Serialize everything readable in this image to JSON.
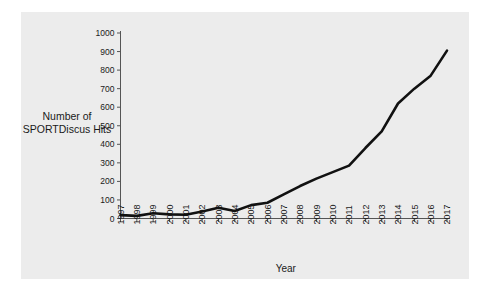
{
  "chart_data": {
    "type": "line",
    "title": "",
    "xlabel": "Year",
    "ylabel": "Number of SPORTDiscus Hits",
    "ylabel_line1": "Number of",
    "ylabel_line2": "SPORTDiscus Hits",
    "categories": [
      "1997",
      "1998",
      "1999",
      "2000",
      "2001",
      "2002",
      "2003",
      "2004",
      "2005",
      "2006",
      "2007",
      "2008",
      "2009",
      "2010",
      "2011",
      "2012",
      "2013",
      "2014",
      "2015",
      "2016",
      "2017"
    ],
    "values": [
      18,
      14,
      28,
      22,
      20,
      38,
      58,
      40,
      72,
      85,
      130,
      175,
      215,
      250,
      285,
      380,
      470,
      620,
      700,
      770,
      905
    ],
    "ylim": [
      0,
      1000
    ],
    "ytick_values": [
      0,
      100,
      200,
      300,
      400,
      500,
      600,
      700,
      800,
      900,
      1000
    ],
    "ytick_labels": [
      "0",
      "100",
      "200",
      "300",
      "400",
      "500",
      "600",
      "700",
      "800",
      "900",
      "1000"
    ],
    "grid": false,
    "legend": "none",
    "line_color": "#111111",
    "line_width": 2.6,
    "plot_background": "#ececec",
    "figure_background": "#ffffff",
    "axis_color": "#555555"
  }
}
